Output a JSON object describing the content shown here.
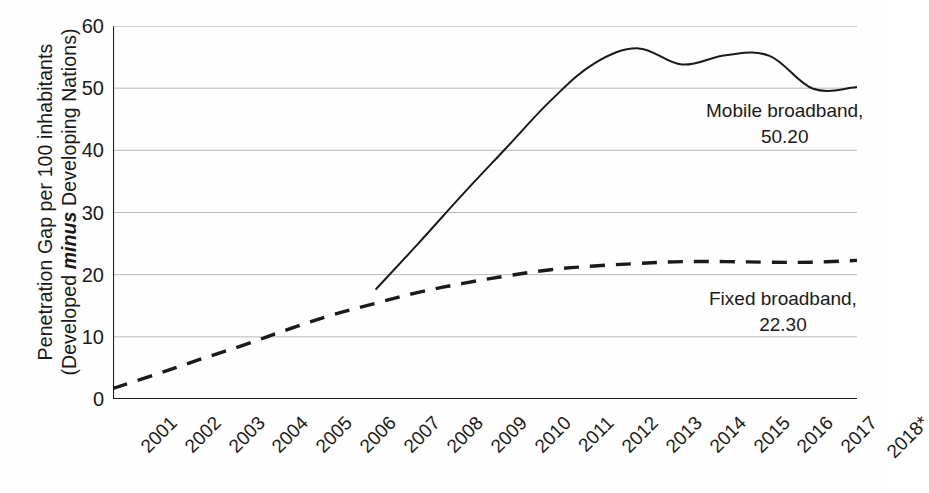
{
  "chart_data": {
    "type": "line",
    "title": "",
    "xlabel": "",
    "ylabel_line1": "Penetration Gap per 100 inhabitants",
    "ylabel_line2_before": "(Developed ",
    "ylabel_line2_emph": "minus",
    "ylabel_line2_after": " Developing Nations)",
    "grid": true,
    "legend_position": "inline-annotation",
    "ylim": [
      0,
      60
    ],
    "yticks": [
      0,
      10,
      20,
      30,
      40,
      50,
      60
    ],
    "ytick_labels": [
      "0",
      "10",
      "20",
      "30",
      "40",
      "50",
      "60"
    ],
    "categories": [
      2001,
      2002,
      2003,
      2004,
      2005,
      2006,
      2007,
      2008,
      2009,
      2010,
      2011,
      2012,
      2013,
      2014,
      2015,
      2016,
      2017,
      2018
    ],
    "xtick_labels": [
      "2001",
      "2002",
      "2003",
      "2004",
      "2005",
      "2006",
      "2007",
      "2008",
      "2009",
      "2010",
      "2011",
      "2012",
      "2013",
      "2014",
      "2015",
      "2016",
      "2017",
      "2018*"
    ],
    "series": [
      {
        "name": "Mobile broadband",
        "style": "solid",
        "color": "#1a1a1a",
        "start_index": 6,
        "values": [
          null,
          null,
          null,
          null,
          null,
          null,
          17.6,
          25.2,
          33.0,
          40.5,
          48.0,
          54.0,
          56.4,
          53.8,
          55.3,
          55.2,
          49.9,
          50.2
        ],
        "end_label": "Mobile broadband,",
        "end_value_label": "50.20"
      },
      {
        "name": "Fixed broadband",
        "style": "dashed",
        "color": "#1a1a1a",
        "start_index": 0,
        "values": [
          1.7,
          4.0,
          6.4,
          8.7,
          11.2,
          13.5,
          15.4,
          17.2,
          18.6,
          19.8,
          20.8,
          21.4,
          21.8,
          22.1,
          22.1,
          22.0,
          22.0,
          22.3
        ],
        "end_label": "Fixed broadband,",
        "end_value_label": "22.30"
      }
    ]
  },
  "annotations": {
    "mobile": {
      "label": "Mobile broadband,",
      "value": "50.20"
    },
    "fixed": {
      "label": "Fixed broadband,",
      "value": "22.30"
    }
  }
}
